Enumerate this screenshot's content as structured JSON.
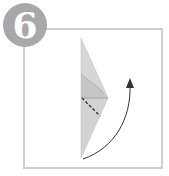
{
  "step": {
    "number": "6",
    "badge_color": "#a8a8a8",
    "frame_color": "#cfcfcf"
  },
  "diagram": {
    "paper_color": "#d4d4d4",
    "paper_shadow_color": "#bdbdbd",
    "fold_line_style": "dashed",
    "arrow_direction": "up-right curved"
  }
}
